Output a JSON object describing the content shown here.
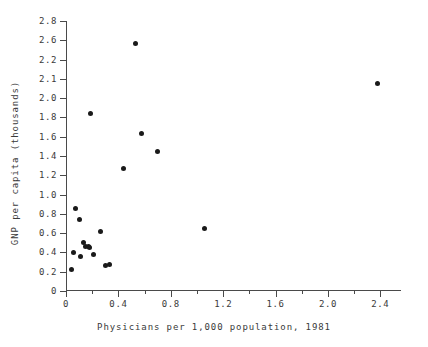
{
  "chart_data": {
    "type": "scatter",
    "title": "",
    "xlabel": "Physicians per 1,000 population, 1981",
    "ylabel": "GNP per capita (thousands)",
    "xlim": [
      0,
      2.55
    ],
    "ylim": [
      0,
      2.8
    ],
    "grid": false,
    "legend": null,
    "x_ticks": [
      {
        "value": 0,
        "label": "0",
        "major": true
      },
      {
        "value": 0.2,
        "label": "",
        "major": false
      },
      {
        "value": 0.4,
        "label": "0.4",
        "major": true
      },
      {
        "value": 0.6,
        "label": "",
        "major": false
      },
      {
        "value": 0.8,
        "label": "0.8",
        "major": true
      },
      {
        "value": 1.0,
        "label": "",
        "major": false
      },
      {
        "value": 1.2,
        "label": "1.2",
        "major": true
      },
      {
        "value": 1.4,
        "label": "",
        "major": false
      },
      {
        "value": 1.6,
        "label": "1.6",
        "major": true
      },
      {
        "value": 1.8,
        "label": "",
        "major": false
      },
      {
        "value": 2.0,
        "label": "2.0",
        "major": true
      },
      {
        "value": 2.2,
        "label": "",
        "major": false
      },
      {
        "value": 2.4,
        "label": "2.4",
        "major": true
      }
    ],
    "y_ticks": [
      {
        "value": 0,
        "label": "0",
        "major": true
      },
      {
        "value": 0.2,
        "label": "0.2",
        "major": true
      },
      {
        "value": 0.4,
        "label": "0.4",
        "major": true
      },
      {
        "value": 0.6,
        "label": "0.6",
        "major": true
      },
      {
        "value": 0.8,
        "label": "0.8",
        "major": true
      },
      {
        "value": 1.0,
        "label": "1.0",
        "major": true
      },
      {
        "value": 1.2,
        "label": "1.2",
        "major": true
      },
      {
        "value": 1.4,
        "label": "1.4",
        "major": true
      },
      {
        "value": 1.6,
        "label": "1.6",
        "major": true
      },
      {
        "value": 1.8,
        "label": "1.8",
        "major": true
      },
      {
        "value": 2.0,
        "label": "2.0",
        "major": true
      },
      {
        "value": 2.2,
        "label": "2.1",
        "major": true
      },
      {
        "value": 2.4,
        "label": "2.2",
        "major": true
      },
      {
        "value": 2.6,
        "label": "2.6",
        "major": true
      },
      {
        "value": 2.8,
        "label": "2.8",
        "major": true
      }
    ],
    "points": [
      {
        "x": 0.04,
        "y": 0.22
      },
      {
        "x": 0.06,
        "y": 0.4
      },
      {
        "x": 0.07,
        "y": 0.86
      },
      {
        "x": 0.1,
        "y": 0.74
      },
      {
        "x": 0.11,
        "y": 0.36
      },
      {
        "x": 0.13,
        "y": 0.5
      },
      {
        "x": 0.15,
        "y": 0.46
      },
      {
        "x": 0.17,
        "y": 0.46
      },
      {
        "x": 0.18,
        "y": 0.45
      },
      {
        "x": 0.19,
        "y": 1.84
      },
      {
        "x": 0.21,
        "y": 0.38
      },
      {
        "x": 0.26,
        "y": 0.62
      },
      {
        "x": 0.3,
        "y": 0.26
      },
      {
        "x": 0.33,
        "y": 0.27
      },
      {
        "x": 0.44,
        "y": 1.27
      },
      {
        "x": 0.53,
        "y": 2.57
      },
      {
        "x": 0.58,
        "y": 1.63
      },
      {
        "x": 0.7,
        "y": 1.45
      },
      {
        "x": 1.06,
        "y": 0.65
      },
      {
        "x": 2.38,
        "y": 2.15
      }
    ],
    "colors": {
      "marker": "#1a1a1a",
      "axis": "#4a4a4a",
      "text": "#3a3a3a",
      "background": "#ffffff"
    }
  }
}
